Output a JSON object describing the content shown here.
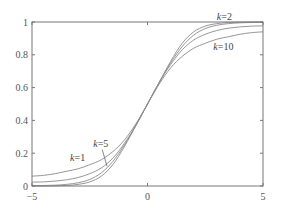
{
  "chart_data": {
    "type": "line",
    "title": "",
    "xlabel": "",
    "ylabel": "",
    "xlim": [
      -5,
      5
    ],
    "ylim": [
      0,
      1
    ],
    "grid": false,
    "legend": "none (inline annotations)",
    "x_ticks": [
      {
        "value": -5,
        "label": "−5"
      },
      {
        "value": 0,
        "label": "0"
      },
      {
        "value": 5,
        "label": "5"
      }
    ],
    "y_ticks": [
      {
        "value": 0,
        "label": "0"
      },
      {
        "value": 0.2,
        "label": "0.2"
      },
      {
        "value": 0.4,
        "label": "0.4"
      },
      {
        "value": 0.6,
        "label": "0.6"
      },
      {
        "value": 0.8,
        "label": "0.8"
      },
      {
        "value": 1,
        "label": "1"
      }
    ],
    "x": [
      0,
      0.5,
      1,
      1.5,
      2,
      2.5,
      3,
      3.5,
      4,
      4.5,
      5
    ],
    "symmetry": "point-symmetric about (0, 0.5); values for negative x are 1 minus the mirrored value",
    "series": [
      {
        "name": "k=1",
        "values": [
          0.5,
          0.62,
          0.72,
          0.79,
          0.84,
          0.87,
          0.895,
          0.91,
          0.925,
          0.935,
          0.94
        ]
      },
      {
        "name": "k=2",
        "values": [
          0.5,
          0.63,
          0.74,
          0.83,
          0.89,
          0.925,
          0.948,
          0.962,
          0.97,
          0.975,
          0.976
        ]
      },
      {
        "name": "k=5",
        "values": [
          0.5,
          0.63,
          0.75,
          0.85,
          0.92,
          0.96,
          0.98,
          0.99,
          0.995,
          0.997,
          0.997
        ]
      },
      {
        "name": "k=10",
        "values": [
          0.5,
          0.63,
          0.76,
          0.87,
          0.94,
          0.975,
          0.99,
          0.997,
          0.999,
          1.0,
          1.0
        ]
      }
    ],
    "annotations": [
      {
        "prefix": "k",
        "suffix": "=2",
        "x": 3.0,
        "y": 1.015
      },
      {
        "prefix": "k",
        "suffix": "=10",
        "x": 2.85,
        "y": 0.83
      },
      {
        "prefix": "k",
        "suffix": "=1",
        "x": -3.35,
        "y": 0.15
      },
      {
        "prefix": "k",
        "suffix": "=5",
        "x": -2.35,
        "y": 0.24,
        "leader_to": {
          "x": -1.75,
          "y": 0.12
        }
      }
    ]
  }
}
